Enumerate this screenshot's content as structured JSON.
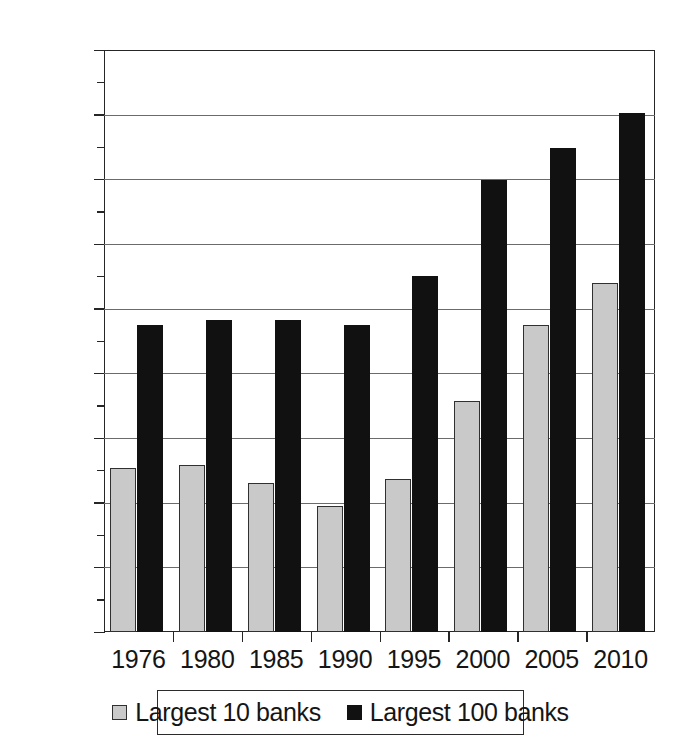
{
  "chart_data": {
    "type": "bar",
    "title": "",
    "subtitle": "",
    "xlabel": "",
    "ylabel": "",
    "categories": [
      "1976",
      "1980",
      "1985",
      "1990",
      "1995",
      "2000",
      "2005",
      "2010"
    ],
    "series": [
      {
        "name": "Largest 10 banks",
        "color": "#c9c9c9",
        "values": [
          25.3,
          25.9,
          23.0,
          19.5,
          23.6,
          35.8,
          47.4,
          54.0
        ]
      },
      {
        "name": "Largest 100 banks",
        "color": "#111111",
        "values": [
          47.4,
          48.2,
          48.3,
          47.5,
          55.0,
          69.9,
          74.8,
          80.3
        ]
      }
    ],
    "ylim": [
      0,
      90
    ],
    "ytick_values": [
      0,
      10,
      20,
      30,
      40,
      50,
      60,
      70,
      80,
      90
    ],
    "ytick_labels": [
      "0%",
      "10%",
      "20%",
      "30%",
      "40%",
      "50%",
      "60%",
      "70%",
      "80%",
      "90%"
    ],
    "value_suffix": "%",
    "grid": true,
    "grid_axis": "y",
    "legend_position": "bottom",
    "legend_entries": [
      "Largest 10 banks",
      "Largest 100 banks"
    ]
  }
}
